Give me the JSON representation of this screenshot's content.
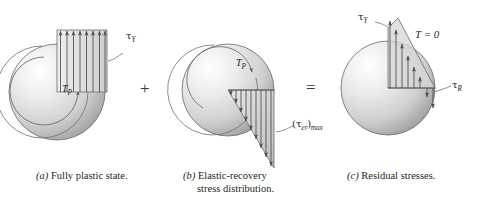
{
  "figure": {
    "operators": {
      "plus": "+",
      "equals": "="
    }
  },
  "panels": [
    {
      "key": "a",
      "tag": "(a)",
      "caption_lines": [
        "Fully plastic state."
      ],
      "labels": {
        "shear_yield": {
          "symbol": "τ",
          "sub": "Y"
        },
        "torque": {
          "symbol": "T",
          "sub": "P"
        }
      },
      "shape": "full-circle with uniform rectangular shear block",
      "arrow_count": 8,
      "arrow_direction": "up",
      "distribution": "uniform"
    },
    {
      "key": "b",
      "tag": "(b)",
      "caption_lines": [
        "Elastic-recovery",
        "stress distribution."
      ],
      "labels": {
        "torque": {
          "symbol": "T",
          "sub": "P"
        },
        "max_elastic_recovery": {
          "symbol": "(τ",
          "sub": "er",
          "suffix": ")",
          "sub2": "max"
        }
      },
      "shape": "circle with triangular elastic-recovery wedge",
      "arrow_count": 9,
      "arrow_direction": "down",
      "distribution": "linear-increasing"
    },
    {
      "key": "c",
      "tag": "(c)",
      "caption_lines": [
        "Residual stresses."
      ],
      "labels": {
        "shear_yield": {
          "symbol": "τ",
          "sub": "Y"
        },
        "residual": {
          "symbol": "τ",
          "sub": "R"
        },
        "zero_torque": {
          "text": "T = 0"
        }
      },
      "shape": "circle with residual stress profile",
      "arrow_count_up": 6,
      "arrow_count_down": 2,
      "distribution": "residual"
    }
  ],
  "colors": {
    "ink": "#231f20",
    "outline": "#5a5a5a",
    "arrow": "#4a4a4a",
    "disk_light": "#fdfdfd",
    "disk_mid": "#d5d5d5",
    "disk_dark": "#9a9a9a",
    "block_fill": "#e2e2e2",
    "wedge_fill": "#cfcfcf",
    "background": "#ffffff"
  }
}
